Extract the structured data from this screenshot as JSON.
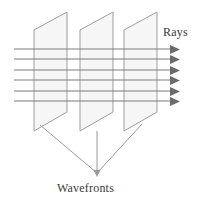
{
  "figure": {
    "labels": {
      "rays": "Rays",
      "wavefronts": "Wavefronts"
    },
    "colors": {
      "background": "#ffffff",
      "plane_fill": "#f6f6f6",
      "plane_stroke": "#9a9a9a",
      "ray_stroke": "#7d7d7d",
      "arrow_fill": "#6b6b6b",
      "leader_stroke": "#9a9a9a",
      "text": "#3a3a3a"
    },
    "counts": {
      "wavefront_planes": 3,
      "rays": 6,
      "leader_lines": 3
    },
    "planes": [
      {
        "name": "wavefront-plane-1",
        "points": "34,30 67,12 67,112 34,131",
        "leader_origin": "40,128"
      },
      {
        "name": "wavefront-plane-2",
        "points": "80,30 113,12 113,112 80,131",
        "leader_origin": "97,131"
      },
      {
        "name": "wavefront-plane-3",
        "points": "124,30 157,12 157,112 124,131",
        "leader_origin": "140,122"
      }
    ],
    "rays": [
      {
        "name": "ray-1",
        "y": 49,
        "x_start": 14,
        "x_end": 176
      },
      {
        "name": "ray-2",
        "y": 59,
        "x_start": 14,
        "x_end": 176
      },
      {
        "name": "ray-3",
        "y": 70,
        "x_start": 14,
        "x_end": 176
      },
      {
        "name": "ray-4",
        "y": 80,
        "x_start": 14,
        "x_end": 176
      },
      {
        "name": "ray-5",
        "y": 91,
        "x_start": 14,
        "x_end": 176
      },
      {
        "name": "ray-6",
        "y": 101,
        "x_start": 14,
        "x_end": 176
      }
    ],
    "leader_convergence_point": {
      "x": 97,
      "y": 176
    }
  }
}
